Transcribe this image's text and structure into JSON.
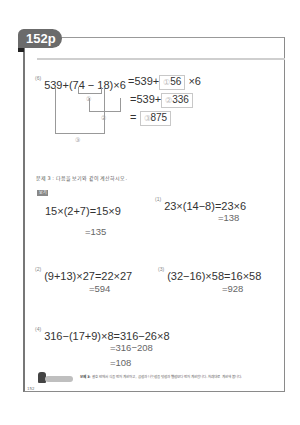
{
  "page_tab": {
    "label": "152p"
  },
  "problem6": {
    "number": "(6)",
    "expression": "539+(74 − 18)×6",
    "step1": {
      "prefix": "=539+",
      "circle": "①",
      "value": "56",
      "suffix": "×6"
    },
    "step2": {
      "prefix": "=539+",
      "circle": "②",
      "value": "336"
    },
    "step3": {
      "prefix": "=",
      "circle": "③",
      "value": "875"
    },
    "bracket_labels": [
      "①",
      "②",
      "③"
    ]
  },
  "section3": {
    "instruction": "문제 3 : 다음을 보기와 같이 계산하시오.",
    "example_badge": "보기",
    "example": {
      "line1": "15×(2+7)=15×9",
      "line2": "=135"
    },
    "problems": [
      {
        "number": "(1)",
        "line1": "23×(14−8)=23×6",
        "line2": "=138"
      },
      {
        "number": "(2)",
        "line1": "(9+13)×27=22×27",
        "line2": "=594"
      },
      {
        "number": "(3)",
        "line1": "(32−16)×58=16×58",
        "line2": "=928"
      },
      {
        "number": "(4)",
        "line1": "316−(17+9)×8=316−26×8",
        "line2": "=316−208",
        "line3": "=108"
      }
    ]
  },
  "footer": {
    "note_label": "문제 3",
    "note_text": ": 괄호 안에서 식을 먼저 계산하고, 곱셈과 나눗셈을 덧셈과 뺄셈보다 먼저 계산합니다. 차례대로 계산해 봅니다.",
    "page_number": "152"
  }
}
